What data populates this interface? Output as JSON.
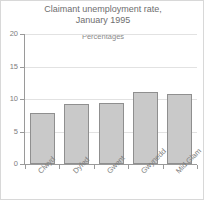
{
  "chart_data": {
    "type": "bar",
    "title": "Claimant unemployment rate,\nJanuary 1995",
    "subtitle": "Percentages",
    "xlabel": "",
    "ylabel": "",
    "ylim": [
      0,
      20
    ],
    "yticks": [
      "0",
      "5",
      "10",
      "15",
      "20"
    ],
    "ytick_values": [
      0,
      5,
      10,
      15,
      20
    ],
    "grid": true,
    "legend": "none",
    "categories": [
      "Clwyd",
      "Dyfed",
      "Gwent",
      "Gwynedd",
      "Mid Glam"
    ],
    "values": [
      7.9,
      9.2,
      9.4,
      11.1,
      10.8
    ],
    "bar_fill_color": "#c9c9c9",
    "bar_border_color": "#8f8f8f",
    "axis_color": "#9a9a9a",
    "grid_color": "#e2e2e2",
    "text_color": "#7a7a7a"
  }
}
